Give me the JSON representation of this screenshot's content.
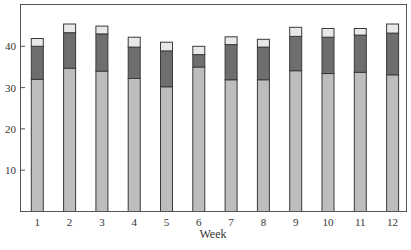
{
  "chart_data": {
    "type": "bar",
    "stacked": true,
    "title": "",
    "xlabel": "Week",
    "ylabel": "",
    "categories": [
      "1",
      "2",
      "3",
      "4",
      "5",
      "6",
      "7",
      "8",
      "9",
      "10",
      "11",
      "12"
    ],
    "series": [
      {
        "name": "Bottom segment",
        "color": "#bdbdbd",
        "values": [
          32.0,
          34.7,
          34.0,
          32.2,
          30.2,
          35.0,
          31.9,
          31.9,
          34.1,
          33.4,
          33.7,
          33.1
        ]
      },
      {
        "name": "Middle segment",
        "color": "#6e6e6e",
        "values": [
          8.0,
          8.6,
          9.0,
          7.6,
          8.7,
          3.0,
          8.5,
          7.9,
          8.3,
          8.8,
          9.0,
          10.1
        ]
      },
      {
        "name": "Top segment",
        "color": "#e8e8e8",
        "values": [
          1.9,
          2.1,
          1.9,
          2.4,
          2.1,
          2.0,
          1.9,
          1.9,
          2.2,
          2.1,
          1.6,
          2.2
        ]
      }
    ],
    "totals": [
      41.9,
      45.4,
      44.9,
      42.2,
      41.0,
      40.0,
      42.3,
      41.7,
      44.6,
      44.3,
      44.3,
      45.4
    ],
    "yticks": [
      10,
      20,
      30,
      40
    ],
    "ylim": [
      0,
      50
    ],
    "grid": false,
    "legend": null
  }
}
